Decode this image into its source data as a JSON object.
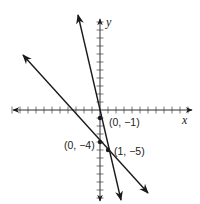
{
  "chart_data": {
    "type": "line",
    "title": "",
    "xlabel": "x",
    "ylabel": "y",
    "xlim": [
      -11,
      11
    ],
    "ylim": [
      -11,
      11
    ],
    "grid": false,
    "tick_step": 1,
    "series": [
      {
        "name": "steep line",
        "equation": "y = -4x - 1",
        "slope": -4,
        "intercept": -1,
        "x": [
          -2.75,
          2.65
        ],
        "y": [
          10,
          -11.6
        ]
      },
      {
        "name": "shallow line",
        "equation": "y = -x - 4",
        "slope": -1,
        "intercept": -4,
        "x": [
          -9.6,
          6.0
        ],
        "y": [
          5.6,
          -10.4
        ]
      }
    ],
    "points": [
      {
        "x": 0,
        "y": -1,
        "label": "(0, −1)"
      },
      {
        "x": 0,
        "y": -4,
        "label": "(0, −4)"
      },
      {
        "x": 1,
        "y": -5,
        "label": "(1, −5)"
      }
    ]
  },
  "labels": {
    "x_axis": "x",
    "y_axis": "y",
    "p1": "(0, −1)",
    "p2": "(0, −4)",
    "p3": "(1, −5)"
  },
  "colors": {
    "ink": "#1a1a1a",
    "background": "#ffffff"
  }
}
